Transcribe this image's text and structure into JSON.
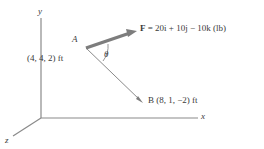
{
  "figure": {
    "axes": {
      "x_label": "x",
      "y_label": "y",
      "z_label": "z"
    },
    "points": {
      "a_label": "A",
      "a_coords": "(4, 4, 2) ft",
      "b_label": "B (8, 1, −2) ft"
    },
    "angle": {
      "symbol": "θ"
    },
    "force": {
      "symbol": "F",
      "equation": " = 20i + 10j − 10k (lb)"
    },
    "colors": {
      "line": "#8a8a8a",
      "arrow": "#7d7d7d",
      "text": "#3a3a3a",
      "background": "#ffffff"
    }
  }
}
